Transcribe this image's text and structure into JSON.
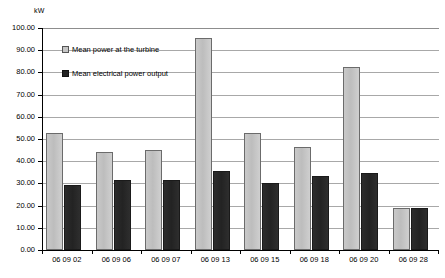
{
  "chart_data": {
    "type": "bar",
    "title": "",
    "subtitle": "",
    "xlabel": "",
    "ylabel": "kW",
    "ylim": [
      0,
      100
    ],
    "ytick_labels": [
      "100.00",
      "90.00",
      "80.00",
      "70.00",
      "60.00",
      "50.00",
      "40.00",
      "30.00",
      "20.00",
      "10.00",
      "0.00"
    ],
    "ytick_values": [
      100,
      90,
      80,
      70,
      60,
      50,
      40,
      30,
      20,
      10,
      0
    ],
    "grid": true,
    "legend_position": "inside-top-left",
    "categories": [
      "06 09 02",
      "06 09 06",
      "06 09 07",
      "06 09 13",
      "06 09 15",
      "06 09 18",
      "06 09 20",
      "06 09 28"
    ],
    "series": [
      {
        "name": "Mean power at the turbine",
        "color": "#c6c6c6",
        "values": [
          52.5,
          44.0,
          45.0,
          95.5,
          52.5,
          46.5,
          82.5,
          19.0
        ]
      },
      {
        "name": "Mean electrical power output",
        "color": "#222222",
        "values": [
          29.5,
          31.5,
          31.5,
          35.5,
          30.0,
          33.5,
          34.5,
          19.0
        ]
      }
    ]
  },
  "axis": {
    "unit_label": "kW"
  },
  "legend": {
    "items": [
      {
        "label": "Mean power at the turbine"
      },
      {
        "label": "Mean electrical power output"
      }
    ]
  }
}
